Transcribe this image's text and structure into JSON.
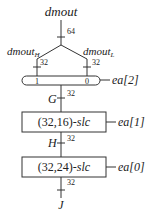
{
  "diagram": {
    "input": {
      "label": "dmout",
      "width": "64"
    },
    "branches": [
      {
        "label": "dmout",
        "subscript": "H",
        "width": "32",
        "mux_port": "1"
      },
      {
        "label": "dmout",
        "subscript": "L",
        "width": "32",
        "mux_port": "0"
      }
    ],
    "mux": {
      "select": "ea[2]"
    },
    "wires": [
      {
        "label": "G",
        "width": "32"
      },
      {
        "label": "H",
        "width": "32"
      },
      {
        "label": "J",
        "width": "32"
      }
    ],
    "blocks": [
      {
        "label_prefix": "(32,16)-",
        "label_suffix": "slc",
        "control": "ea[1]"
      },
      {
        "label_prefix": "(32,24)-",
        "label_suffix": "slc",
        "control": "ea[0]"
      }
    ]
  }
}
